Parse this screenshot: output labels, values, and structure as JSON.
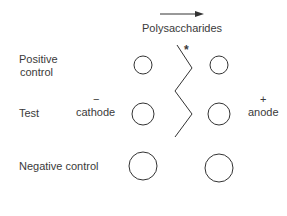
{
  "header": {
    "arrow_label": "Polysaccharides"
  },
  "rows": [
    {
      "label_line1": "Positive",
      "label_line2": "control"
    },
    {
      "label": "Test"
    },
    {
      "label": "Negative control"
    }
  ],
  "electrodes": {
    "cathode_sign": "−",
    "cathode_label": "cathode",
    "anode_sign": "+",
    "anode_label": "anode"
  },
  "marker": {
    "asterisk": "*"
  }
}
